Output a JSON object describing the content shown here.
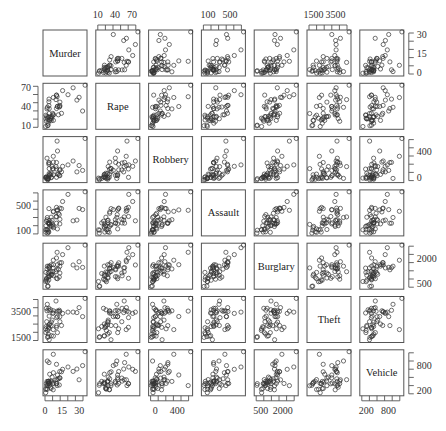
{
  "chart_data": {
    "type": "scatter-matrix",
    "title": "",
    "variables": [
      "Murder",
      "Rape",
      "Robbery",
      "Assault",
      "Burglary",
      "Theft",
      "Vehicle"
    ],
    "n_points": 50,
    "axes": {
      "top": [
        {
          "column": 1,
          "variable": "Rape",
          "tick_labels": [
            "10",
            "40",
            "70"
          ],
          "range": [
            5,
            75
          ]
        },
        {
          "column": 3,
          "variable": "Assault",
          "tick_labels": [
            "100",
            "500"
          ],
          "range": [
            50,
            750
          ]
        },
        {
          "column": 5,
          "variable": "Theft",
          "tick_labels": [
            "1500",
            "3500"
          ],
          "range": [
            1200,
            4200
          ]
        }
      ],
      "bottom": [
        {
          "column": 0,
          "variable": "Murder",
          "tick_labels": [
            "0",
            "15",
            "30"
          ],
          "range": [
            0,
            32
          ]
        },
        {
          "column": 2,
          "variable": "Robbery",
          "tick_labels": [
            "0",
            "400"
          ],
          "range": [
            0,
            700
          ]
        },
        {
          "column": 4,
          "variable": "Burglary",
          "tick_labels": [
            "500",
            "2000"
          ],
          "range": [
            300,
            2500
          ]
        },
        {
          "column": 6,
          "variable": "Vehicle",
          "tick_labels": [
            "200",
            "800"
          ],
          "range": [
            100,
            1000
          ]
        }
      ],
      "left": [
        {
          "row": 1,
          "variable": "Rape",
          "tick_labels": [
            "70",
            "40",
            "10"
          ],
          "range": [
            5,
            75
          ]
        },
        {
          "row": 3,
          "variable": "Assault",
          "tick_labels": [
            "500",
            "100"
          ],
          "range": [
            50,
            750
          ]
        },
        {
          "row": 5,
          "variable": "Theft",
          "tick_labels": [
            "3500",
            "1500"
          ],
          "range": [
            1200,
            4200
          ]
        }
      ],
      "right": [
        {
          "row": 0,
          "variable": "Murder",
          "tick_labels": [
            "30",
            "15",
            "0"
          ],
          "range": [
            0,
            32
          ]
        },
        {
          "row": 2,
          "variable": "Robbery",
          "tick_labels": [
            "400",
            "0"
          ],
          "range": [
            0,
            700
          ]
        },
        {
          "row": 4,
          "variable": "Burglary",
          "tick_labels": [
            "2000",
            "500"
          ],
          "range": [
            300,
            2500
          ]
        },
        {
          "row": 6,
          "variable": "Vehicle",
          "tick_labels": [
            "800",
            "200"
          ],
          "range": [
            100,
            1000
          ]
        }
      ]
    },
    "correlations": {
      "Murder-Rape": 0.6,
      "Murder-Robbery": 0.55,
      "Murder-Assault": 0.7,
      "Murder-Burglary": 0.6,
      "Murder-Theft": 0.25,
      "Murder-Vehicle": 0.5,
      "Rape-Robbery": 0.55,
      "Rape-Assault": 0.65,
      "Rape-Burglary": 0.7,
      "Rape-Theft": 0.45,
      "Rape-Vehicle": 0.45,
      "Robbery-Assault": 0.65,
      "Robbery-Burglary": 0.6,
      "Robbery-Theft": 0.35,
      "Robbery-Vehicle": 0.7,
      "Assault-Burglary": 0.65,
      "Assault-Theft": 0.4,
      "Assault-Vehicle": 0.45,
      "Burglary-Theft": 0.6,
      "Burglary-Vehicle": 0.5,
      "Theft-Vehicle": 0.4
    },
    "skew": {
      "Murder": 0.7,
      "Rape": 0.35,
      "Robbery": 0.8,
      "Assault": 0.4,
      "Burglary": 0.2,
      "Theft": 0.0,
      "Vehicle": 0.35
    },
    "grid": false,
    "legend": null,
    "marker": "open-circle"
  },
  "layout": {
    "origin_x": 43,
    "origin_y": 30,
    "pitch_x": 52.8,
    "pitch_y": 53.3,
    "panel_w": 44,
    "panel_h": 46
  }
}
